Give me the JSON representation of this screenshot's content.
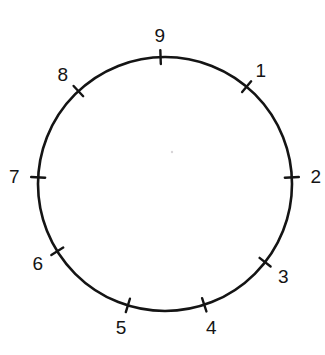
{
  "figure": {
    "type": "clock-face-circle-diagram",
    "title": "",
    "background_color": "#ffffff",
    "stroke_color": "#141414",
    "center_marker_color": "#d8d4d8",
    "canvas": {
      "width": 325,
      "height": 355
    },
    "circle": {
      "center_x": 165,
      "center_y": 184,
      "radius": 127,
      "stroke_width": 2.6
    },
    "center_marker": {
      "x": 172,
      "y": 152,
      "radius": 1.2,
      "visible": true
    },
    "tick_marks": [
      {
        "label": "9",
        "angle_deg": 92,
        "label_offset": 22,
        "tick_inner": 7,
        "tick_outer": 7
      },
      {
        "label": "1",
        "angle_deg": 50,
        "label_offset": 22,
        "tick_inner": 7,
        "tick_outer": 7
      },
      {
        "label": "2",
        "angle_deg": 3,
        "label_offset": 24,
        "tick_inner": 7,
        "tick_outer": 7
      },
      {
        "label": "3",
        "angle_deg": -38,
        "label_offset": 23,
        "tick_inner": 7,
        "tick_outer": 7
      },
      {
        "label": "4",
        "angle_deg": -72,
        "label_offset": 23,
        "tick_inner": 7,
        "tick_outer": 7
      },
      {
        "label": "5",
        "angle_deg": -107,
        "label_offset": 23,
        "tick_inner": 7,
        "tick_outer": 7
      },
      {
        "label": "6",
        "angle_deg": -148,
        "label_offset": 23,
        "tick_inner": 7,
        "tick_outer": 7
      },
      {
        "label": "7",
        "angle_deg": 177,
        "label_offset": 24,
        "tick_inner": 7,
        "tick_outer": 7
      },
      {
        "label": "8",
        "angle_deg": 133,
        "label_offset": 23,
        "tick_inner": 7,
        "tick_outer": 7
      }
    ],
    "labels_in_order": [
      "9",
      "1",
      "2",
      "3",
      "4",
      "5",
      "6",
      "7",
      "8"
    ],
    "label_count": 9,
    "font_size_px": 19
  }
}
